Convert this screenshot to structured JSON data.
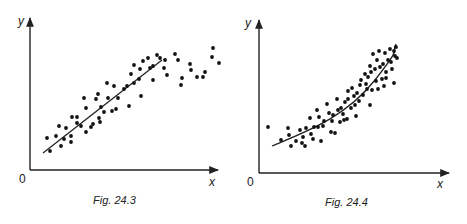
{
  "chart_data": [
    {
      "type": "scatter",
      "title": "Fig. 24.3",
      "xlabel": "x",
      "ylabel": "y",
      "origin_label": "0",
      "grid": false,
      "trend": "linear",
      "description": "Scatter showing positive linear correlation with straight best-fit line",
      "points_px": [
        [
          47,
          138
        ],
        [
          50,
          151
        ],
        [
          56,
          136
        ],
        [
          59,
          126
        ],
        [
          61,
          146
        ],
        [
          64,
          139
        ],
        [
          66,
          128
        ],
        [
          71,
          136
        ],
        [
          71,
          142
        ],
        [
          72,
          117
        ],
        [
          77,
          123
        ],
        [
          77,
          117
        ],
        [
          81,
          126
        ],
        [
          84,
          98
        ],
        [
          86,
          108
        ],
        [
          86,
          132
        ],
        [
          91,
          127
        ],
        [
          93,
          124
        ],
        [
          96,
          99
        ],
        [
          98,
          94
        ],
        [
          99,
          118
        ],
        [
          100,
          122
        ],
        [
          101,
          107
        ],
        [
          104,
          112
        ],
        [
          108,
          98
        ],
        [
          112,
          111
        ],
        [
          107,
          83
        ],
        [
          114,
          86
        ],
        [
          118,
          98
        ],
        [
          116,
          109
        ],
        [
          124,
          89
        ],
        [
          127,
          86
        ],
        [
          131,
          74
        ],
        [
          129,
          106
        ],
        [
          134,
          65
        ],
        [
          134,
          83
        ],
        [
          139,
          79
        ],
        [
          140,
          69
        ],
        [
          141,
          96
        ],
        [
          143,
          61
        ],
        [
          148,
          58
        ],
        [
          150,
          68
        ],
        [
          153,
          80
        ],
        [
          153,
          66
        ],
        [
          157,
          55
        ],
        [
          160,
          58
        ],
        [
          165,
          60
        ],
        [
          164,
          68
        ],
        [
          167,
          75
        ],
        [
          175,
          54
        ],
        [
          178,
          60
        ],
        [
          182,
          78
        ],
        [
          181,
          85
        ],
        [
          190,
          64
        ],
        [
          191,
          70
        ],
        [
          197,
          77
        ],
        [
          203,
          77
        ],
        [
          205,
          72
        ],
        [
          212,
          57
        ],
        [
          213,
          48
        ],
        [
          219,
          63
        ]
      ],
      "fit_line_px": [
        [
          43,
          153
        ],
        [
          162,
          60
        ]
      ]
    },
    {
      "type": "scatter",
      "title": "Fig. 24.4",
      "xlabel": "x",
      "ylabel": "y",
      "origin_label": "0",
      "grid": false,
      "trend": "curvilinear (exponential-like)",
      "description": "Scatter showing non-linear positive relationship with curved best-fit line",
      "points_px": [
        [
          268,
          127
        ],
        [
          281,
          140
        ],
        [
          288,
          128
        ],
        [
          289,
          135
        ],
        [
          291,
          146
        ],
        [
          296,
          141
        ],
        [
          300,
          130
        ],
        [
          302,
          143
        ],
        [
          303,
          137
        ],
        [
          305,
          146
        ],
        [
          306,
          128
        ],
        [
          310,
          118
        ],
        [
          311,
          134
        ],
        [
          313,
          139
        ],
        [
          314,
          127
        ],
        [
          317,
          110
        ],
        [
          318,
          127
        ],
        [
          319,
          117
        ],
        [
          321,
          141
        ],
        [
          323,
          126
        ],
        [
          324,
          121
        ],
        [
          327,
          104
        ],
        [
          329,
          113
        ],
        [
          331,
          132
        ],
        [
          332,
          121
        ],
        [
          333,
          115
        ],
        [
          335,
          133
        ],
        [
          337,
          99
        ],
        [
          338,
          110
        ],
        [
          340,
          122
        ],
        [
          341,
          108
        ],
        [
          343,
          114
        ],
        [
          344,
          120
        ],
        [
          345,
          102
        ],
        [
          347,
          119
        ],
        [
          348,
          91
        ],
        [
          348,
          99
        ],
        [
          351,
          108
        ],
        [
          352,
          88
        ],
        [
          354,
          96
        ],
        [
          355,
          105
        ],
        [
          356,
          116
        ],
        [
          357,
          93
        ],
        [
          359,
          101
        ],
        [
          360,
          85
        ],
        [
          361,
          80
        ],
        [
          363,
          95
        ],
        [
          365,
          74
        ],
        [
          366,
          84
        ],
        [
          367,
          89
        ],
        [
          368,
          77
        ],
        [
          370,
          105
        ],
        [
          370,
          66
        ],
        [
          371,
          72
        ],
        [
          372,
          90
        ],
        [
          373,
          54
        ],
        [
          375,
          69
        ],
        [
          376,
          81
        ],
        [
          377,
          60
        ],
        [
          378,
          89
        ],
        [
          379,
          51
        ],
        [
          380,
          67
        ],
        [
          382,
          79
        ],
        [
          383,
          64
        ],
        [
          384,
          86
        ],
        [
          385,
          53
        ],
        [
          386,
          78
        ],
        [
          386,
          72
        ],
        [
          388,
          60
        ],
        [
          390,
          49
        ],
        [
          391,
          62
        ],
        [
          392,
          69
        ],
        [
          394,
          51
        ],
        [
          394,
          83
        ],
        [
          395,
          56
        ],
        [
          396,
          47
        ],
        [
          397,
          58
        ]
      ],
      "fit_curve_px": "M272,146 C 305,132 345,118 375,80 S 390,55 396,44"
    }
  ],
  "figures": [
    {
      "caption": "Fig. 24.3",
      "x_label": "x",
      "y_label": "y",
      "origin": "0"
    },
    {
      "caption": "Fig. 24.4",
      "x_label": "x",
      "y_label": "y",
      "origin": "0"
    }
  ]
}
